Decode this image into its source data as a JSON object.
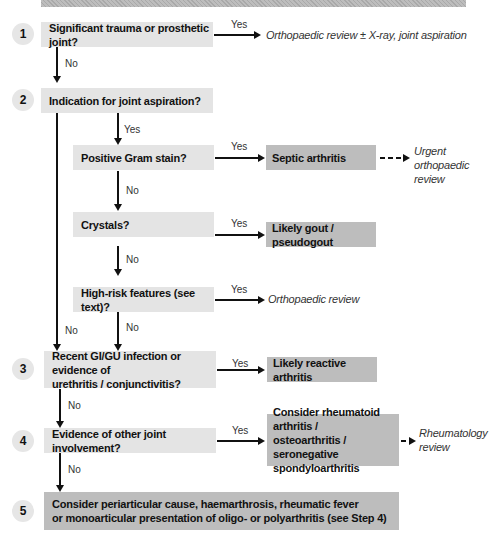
{
  "banner": {
    "color": "#b3b3b3"
  },
  "colors": {
    "question_box": "#e4e4e4",
    "result_box": "#bdbdbd",
    "step_circle": "#e6e6e6",
    "arrow": "#111111"
  },
  "steps": [
    {
      "number": "1",
      "question": "Significant trauma or prosthetic joint?",
      "yes_label": "Yes",
      "yes_outcome": "Orthopaedic review ± X-ray, joint aspiration",
      "no_label": "No"
    },
    {
      "number": "2",
      "question": "Indication for joint aspiration?",
      "yes_label": "Yes",
      "no_label": "No",
      "sub": [
        {
          "question": "Positive Gram stain?",
          "yes_label": "Yes",
          "result": "Septic arthritis",
          "next_line1": "Urgent",
          "next_line2": "orthopaedic",
          "next_line3": "review",
          "no_label": "No"
        },
        {
          "question": "Crystals?",
          "yes_label": "Yes",
          "result": "Likely gout / pseudogout",
          "no_label": "No"
        },
        {
          "question": "High-risk features (see text)?",
          "yes_label": "Yes",
          "outcome": "Orthopaedic review",
          "no_label": "No"
        }
      ]
    },
    {
      "number": "3",
      "question_line1": "Recent GI/GU infection or evidence of",
      "question_line2": "urethritis / conjunctivitis?",
      "yes_label": "Yes",
      "result": "Likely reactive arthritis",
      "no_label": "No"
    },
    {
      "number": "4",
      "question": "Evidence of other joint involvement?",
      "yes_label": "Yes",
      "result_line1": "Consider rheumatoid arthritis /",
      "result_line2": "osteoarthritis / seronegative",
      "result_line3": "spondyloarthritis",
      "next_line1": "Rheumatology",
      "next_line2": "review",
      "no_label": "No"
    },
    {
      "number": "5",
      "text_line1": "Consider periarticular cause, haemarthrosis, rheumatic fever",
      "text_line2": "or monoarticular presentation of oligo- or polyarthritis (see Step 4)"
    }
  ]
}
